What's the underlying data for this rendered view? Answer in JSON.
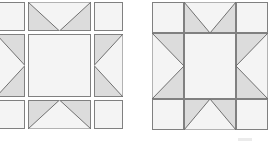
{
  "figure": {
    "background_color": "#ffffff"
  },
  "colors": {
    "shaded_fill": "#dcdcdc",
    "light_fill": "#f4f4f4",
    "outline": "#808080",
    "diagonal_line": "#707070",
    "faint_mark": "#ebebeb"
  },
  "diagrams": [
    {
      "id": "exploded-block",
      "name": "Exploded star block",
      "layout": "separated",
      "x": -4,
      "y": 2,
      "cell_width": 29,
      "cell_height": 29,
      "center_width": 63,
      "center_height": 63,
      "gap": 3,
      "cells": [
        {
          "row": 0,
          "col": 0,
          "name": "corner-top-left",
          "pattern": "plain-light"
        },
        {
          "row": 0,
          "col": 1,
          "name": "flying-geese-top",
          "pattern": "geese-down"
        },
        {
          "row": 0,
          "col": 2,
          "name": "corner-top-right",
          "pattern": "plain-light"
        },
        {
          "row": 1,
          "col": 0,
          "name": "flying-geese-left",
          "pattern": "geese-right"
        },
        {
          "row": 1,
          "col": 1,
          "name": "center-square",
          "pattern": "plain-light"
        },
        {
          "row": 1,
          "col": 2,
          "name": "flying-geese-right",
          "pattern": "geese-left"
        },
        {
          "row": 2,
          "col": 0,
          "name": "corner-bottom-left",
          "pattern": "plain-light"
        },
        {
          "row": 2,
          "col": 1,
          "name": "flying-geese-bottom",
          "pattern": "geese-up"
        },
        {
          "row": 2,
          "col": 2,
          "name": "corner-bottom-right",
          "pattern": "plain-light"
        }
      ]
    },
    {
      "id": "assembled-block",
      "name": "Assembled star block",
      "layout": "joined",
      "x": 152,
      "y": 2,
      "cell_width": 32,
      "cell_height": 31,
      "center_width": 52,
      "center_height": 66,
      "gap": 0,
      "cells": [
        {
          "row": 0,
          "col": 0,
          "name": "corner-top-left",
          "pattern": "plain-light"
        },
        {
          "row": 0,
          "col": 1,
          "name": "flying-geese-top",
          "pattern": "geese-down"
        },
        {
          "row": 0,
          "col": 2,
          "name": "corner-top-right",
          "pattern": "plain-light"
        },
        {
          "row": 1,
          "col": 0,
          "name": "flying-geese-left",
          "pattern": "geese-right"
        },
        {
          "row": 1,
          "col": 1,
          "name": "center-square",
          "pattern": "plain-light"
        },
        {
          "row": 1,
          "col": 2,
          "name": "flying-geese-right",
          "pattern": "geese-left"
        },
        {
          "row": 2,
          "col": 0,
          "name": "corner-bottom-left",
          "pattern": "plain-light"
        },
        {
          "row": 2,
          "col": 1,
          "name": "flying-geese-bottom",
          "pattern": "geese-up"
        },
        {
          "row": 2,
          "col": 2,
          "name": "corner-bottom-right",
          "pattern": "plain-light"
        }
      ]
    }
  ],
  "marks": [
    {
      "name": "faint-smudge",
      "x": 238,
      "y": 138,
      "width": 14,
      "height": 3
    }
  ]
}
